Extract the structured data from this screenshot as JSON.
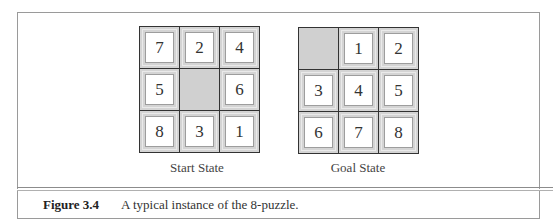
{
  "figure": {
    "number": "Figure 3.4",
    "caption": "A typical instance of the 8-puzzle."
  },
  "start_state": {
    "label": "Start State",
    "cells": [
      "7",
      "2",
      "4",
      "5",
      "",
      "6",
      "8",
      "3",
      "1"
    ]
  },
  "goal_state": {
    "label": "Goal State",
    "cells": [
      "",
      "1",
      "2",
      "3",
      "4",
      "5",
      "6",
      "7",
      "8"
    ]
  }
}
